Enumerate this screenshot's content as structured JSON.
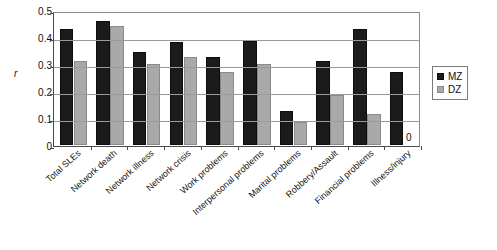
{
  "chart_data": {
    "type": "bar",
    "title": "",
    "xlabel": "",
    "ylabel": "r",
    "ylim": [
      0,
      0.5
    ],
    "ytick_labels": [
      "0.5",
      "0.4",
      "0.3",
      "0.2",
      "0.1",
      "0"
    ],
    "ytick_values": [
      0.5,
      0.4,
      0.3,
      0.2,
      0.1,
      0
    ],
    "grid": true,
    "legend_position": "right",
    "categories": [
      "Total SLEs",
      "Network death",
      "Network illness",
      "Network crisis",
      "Work problems",
      "Interpersonal problems",
      "Marital problems",
      "Robbery/Assault",
      "Financial problems",
      "Illness/injury"
    ],
    "series": [
      {
        "name": "MZ",
        "color": "#1b1b1b",
        "values": [
          0.43,
          0.46,
          0.345,
          0.38,
          0.325,
          0.385,
          0.125,
          0.31,
          0.43,
          0.27
        ]
      },
      {
        "name": "DZ",
        "color": "#a9a9a9",
        "values": [
          0.31,
          0.44,
          0.3,
          0.325,
          0.27,
          0.3,
          0.085,
          0.185,
          0.115,
          0.0
        ]
      }
    ],
    "annotations": [
      {
        "text": "0",
        "category": "Illness/injury",
        "series": "DZ"
      }
    ]
  },
  "legend": {
    "items": [
      {
        "label": "MZ"
      },
      {
        "label": "DZ"
      }
    ]
  }
}
